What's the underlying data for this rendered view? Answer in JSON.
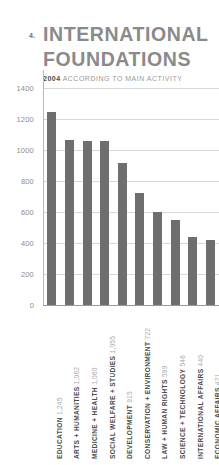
{
  "header": {
    "chapter_number": "4.",
    "title_line_1": "INTERNATIONAL",
    "title_line_2": "FOUNDATIONS",
    "subtitle_year": "2004",
    "subtitle_rest": "ACCORDING TO MAIN ACTIVITY"
  },
  "colors": {
    "bar": "#6e6e6e",
    "title": "#8a8a8a",
    "grid": "#d8d8d8",
    "axis_text": "#8c8c8c",
    "category_text": "#4d4d4d",
    "value_text": "#a8a8a8",
    "background": "#ffffff"
  },
  "chart_data": {
    "type": "bar",
    "title": "INTERNATIONAL FOUNDATIONS",
    "subtitle": "2004 ACCORDING TO MAIN ACTIVITY",
    "xlabel": "",
    "ylabel": "",
    "ylim": [
      0,
      1400
    ],
    "grid": true,
    "legend": "none",
    "orientation": "vertical",
    "yticks": [
      0,
      200,
      400,
      600,
      800,
      1000,
      1200,
      1400
    ],
    "ytick_labels": [
      "0",
      "200",
      "400",
      "600",
      "800",
      "1000",
      "1200",
      "1400"
    ],
    "categories": [
      "EDUCATION",
      "ARTS + HUMANITIES",
      "MEDICINE + HEALTH",
      "SOCIAL WELFARE + STUDIES",
      "DEVELOPMENT",
      "CONSERVATION + ENVIRONMENT",
      "LAW + HUMAN RIGHTS",
      "SCIENCE + TECHNOLOGY",
      "INTERNATIONAL AFFAIRS",
      "ECONOMIC AFFAIRS"
    ],
    "values": [
      1245,
      1062,
      1060,
      1055,
      915,
      722,
      599,
      546,
      440,
      421
    ],
    "value_labels": [
      "1,245",
      "1,062",
      "1,060",
      "1,055",
      "915",
      "722",
      "599",
      "546",
      "440",
      "421"
    ],
    "tick_labels_combined": [
      "EDUCATION 1,245",
      "ARTS + HUMANITIES 1,062",
      "MEDICINE + HEALTH 1,060",
      "SOCIAL WELFARE + STUDIES 1,055",
      "DEVELOPMENT 915",
      "CONSERVATION + ENVIRONMENT 722",
      "LAW + HUMAN RIGHTS 599",
      "SCIENCE + TECHNOLOGY 546",
      "INTERNATIONAL AFFAIRS 440",
      "ECONOMIC AFFAIRS 421"
    ]
  }
}
